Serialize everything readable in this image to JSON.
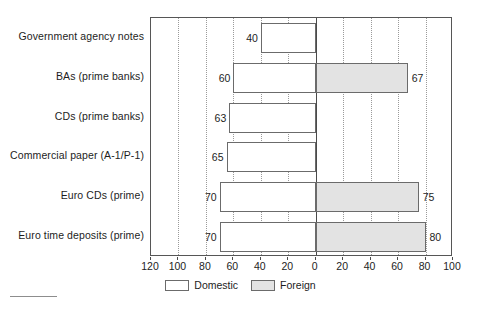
{
  "chart_data": {
    "type": "bar",
    "orientation": "horizontal",
    "title": "",
    "subtitle": "",
    "xlabel": "",
    "ylabel": "",
    "categories": [
      "Government agency notes",
      "BAs (prime banks)",
      "CDs (prime banks)",
      "Commercial paper (A-1/P-1)",
      "Euro CDs (prime)",
      "Euro time deposits (prime)"
    ],
    "series": [
      {
        "name": "Domestic",
        "color": "#ffffff",
        "direction": "left",
        "values": [
          40,
          60,
          63,
          65,
          70,
          70
        ],
        "labels": [
          "40",
          "60",
          "63",
          "65",
          "70",
          "70"
        ]
      },
      {
        "name": "Foreign",
        "color": "#e3e3e3",
        "direction": "right",
        "values": [
          0,
          67,
          0,
          0,
          75,
          80
        ],
        "labels": [
          "",
          "67",
          "",
          "",
          "75",
          "80"
        ]
      }
    ],
    "xlim": [
      -120,
      100
    ],
    "xticks": [
      -120,
      -100,
      -80,
      -60,
      -40,
      -20,
      0,
      20,
      40,
      60,
      80,
      100
    ],
    "xtick_labels": [
      "120",
      "100",
      "80",
      "60",
      "40",
      "20",
      "0",
      "20",
      "40",
      "60",
      "80",
      "100"
    ],
    "grid": true,
    "grid_style": "dotted-vertical",
    "legend_position": "bottom-center",
    "legend": [
      {
        "label": "Domestic",
        "swatch": "white-box"
      },
      {
        "label": "Foreign",
        "swatch": "gray-box"
      }
    ]
  },
  "colors": {
    "domestic_fill": "#ffffff",
    "foreign_fill": "#e3e3e3",
    "bar_border": "#6b6b6b",
    "frame": "#565656",
    "gridline": "#9a9a9a",
    "zeroline": "#4a4a4a",
    "text": "#1d1d1d",
    "background": "#ffffff"
  }
}
